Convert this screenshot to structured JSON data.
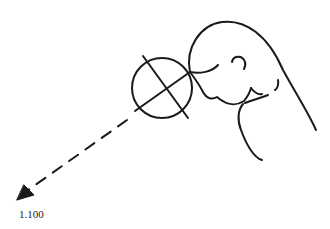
{
  "figure": {
    "label": "1.100",
    "colors": {
      "stroke": "#1a1a1a",
      "background": "#ffffff"
    }
  }
}
